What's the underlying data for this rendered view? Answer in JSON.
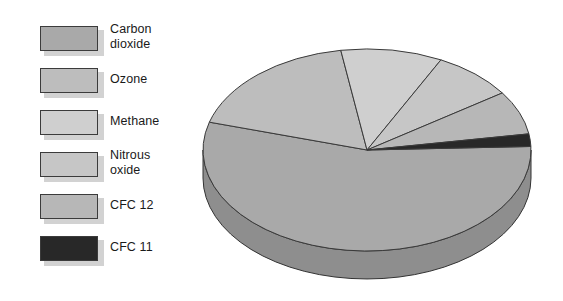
{
  "figure": {
    "background_color": "#ffffff"
  },
  "legend": {
    "items": [
      {
        "label": "Carbon\ndioxide",
        "color": "#a9a9a9",
        "two_line": true,
        "name": "carbon-dioxide"
      },
      {
        "label": "Ozone",
        "color": "#bdbdbd",
        "two_line": false,
        "name": "ozone"
      },
      {
        "label": "Methane",
        "color": "#cfcfcf",
        "two_line": false,
        "name": "methane"
      },
      {
        "label": "Nitrous\noxide",
        "color": "#c6c6c6",
        "two_line": true,
        "name": "nitrous-oxide"
      },
      {
        "label": "CFC 12",
        "color": "#b7b7b7",
        "two_line": false,
        "name": "cfc-12"
      },
      {
        "label": "CFC 11",
        "color": "#282828",
        "two_line": false,
        "name": "cfc-11"
      }
    ]
  },
  "chart_data": {
    "type": "pie",
    "title": "",
    "subtitle": "",
    "xlabel": "",
    "ylabel": "",
    "three_d": true,
    "legend_position": "left",
    "grid": false,
    "categories": [
      "Carbon dioxide",
      "Ozone",
      "Methane",
      "Nitrous oxide",
      "CFC 12",
      "CFC 11"
    ],
    "values": [
      55,
      18,
      10,
      8,
      7,
      2
    ],
    "units": "percent",
    "series": [
      {
        "name": "Share of greenhouse effect",
        "values": [
          55,
          18,
          10,
          8,
          7,
          2
        ]
      }
    ],
    "slices": [
      {
        "label": "Carbon dioxide",
        "value": 55,
        "color": "#a9a9a9",
        "side_color": "#8e8e8e"
      },
      {
        "label": "Ozone",
        "value": 18,
        "color": "#bdbdbd",
        "side_color": "#a0a0a0"
      },
      {
        "label": "Methane",
        "value": 10,
        "color": "#cfcfcf",
        "side_color": "#b0b0b0"
      },
      {
        "label": "Nitrous oxide",
        "value": 8,
        "color": "#c6c6c6",
        "side_color": "#a8a8a8"
      },
      {
        "label": "CFC 12",
        "value": 7,
        "color": "#b7b7b7",
        "side_color": "#9a9a9a"
      },
      {
        "label": "CFC 11",
        "value": 2,
        "color": "#282828",
        "side_color": "#1a1a1a"
      }
    ],
    "geometry": {
      "center_x": 179,
      "center_y": 130,
      "radius_x": 164,
      "radius_y": 101,
      "depth": 28,
      "start_angle_deg": -2
    }
  }
}
